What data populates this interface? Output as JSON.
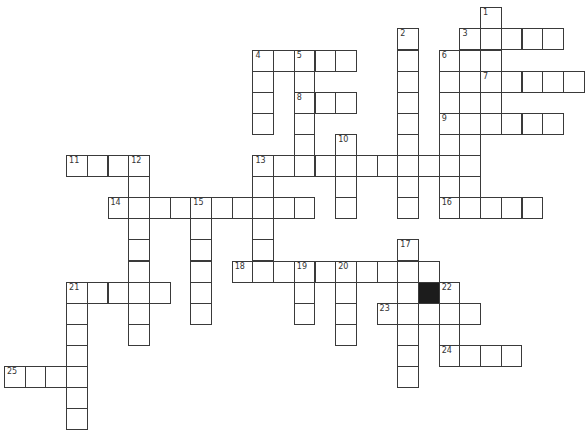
{
  "puzzle": {
    "cell_width": 20.7,
    "cell_height": 21.1,
    "origin_x": 4,
    "origin_y": 7.3,
    "colors": {
      "line": "#3a3a3a",
      "block": "#1c1c1c",
      "background": "#ffffff",
      "number": "#333333"
    },
    "black_cells": [
      [
        20,
        13
      ]
    ],
    "entries": [
      {
        "number": "1",
        "direction": "down",
        "col": 23,
        "row": 0,
        "length": 5
      },
      {
        "number": "2",
        "direction": "down",
        "col": 19,
        "row": 1,
        "length": 9
      },
      {
        "number": "3",
        "direction": "across",
        "col": 22,
        "row": 1,
        "length": 5
      },
      {
        "number": "3",
        "direction": "down",
        "col": 22,
        "row": 1,
        "length": 9
      },
      {
        "number": "4",
        "direction": "across",
        "col": 12,
        "row": 2,
        "length": 5
      },
      {
        "number": "4",
        "direction": "down",
        "col": 12,
        "row": 2,
        "length": 4
      },
      {
        "number": "5",
        "direction": "down",
        "col": 14,
        "row": 2,
        "length": 6
      },
      {
        "number": "6",
        "direction": "down",
        "col": 21,
        "row": 2,
        "length": 8
      },
      {
        "number": "7",
        "direction": "across",
        "col": 23,
        "row": 3,
        "length": 5
      },
      {
        "number": "8",
        "direction": "across",
        "col": 14,
        "row": 4,
        "length": 3
      },
      {
        "number": "9",
        "direction": "across",
        "col": 21,
        "row": 5,
        "length": 6
      },
      {
        "number": "10",
        "direction": "down",
        "col": 16,
        "row": 6,
        "length": 4
      },
      {
        "number": "11",
        "direction": "across",
        "col": 3,
        "row": 7,
        "length": 4
      },
      {
        "number": "12",
        "direction": "down",
        "col": 6,
        "row": 7,
        "length": 9
      },
      {
        "number": "13",
        "direction": "across",
        "col": 12,
        "row": 7,
        "length": 11
      },
      {
        "number": "13",
        "direction": "down",
        "col": 12,
        "row": 7,
        "length": 6
      },
      {
        "number": "14",
        "direction": "across",
        "col": 5,
        "row": 9,
        "length": 10
      },
      {
        "number": "15",
        "direction": "down",
        "col": 9,
        "row": 9,
        "length": 6
      },
      {
        "number": "16",
        "direction": "across",
        "col": 21,
        "row": 9,
        "length": 5
      },
      {
        "number": "17",
        "direction": "down",
        "col": 19,
        "row": 11,
        "length": 7
      },
      {
        "number": "18",
        "direction": "across",
        "col": 11,
        "row": 12,
        "length": 10
      },
      {
        "number": "19",
        "direction": "down",
        "col": 14,
        "row": 12,
        "length": 3
      },
      {
        "number": "20",
        "direction": "down",
        "col": 16,
        "row": 12,
        "length": 4
      },
      {
        "number": "21",
        "direction": "across",
        "col": 3,
        "row": 13,
        "length": 5
      },
      {
        "number": "21",
        "direction": "down",
        "col": 3,
        "row": 13,
        "length": 7
      },
      {
        "number": "22",
        "direction": "down",
        "col": 21,
        "row": 13,
        "length": 4
      },
      {
        "number": "23",
        "direction": "across",
        "col": 18,
        "row": 14,
        "length": 5
      },
      {
        "number": "24",
        "direction": "across",
        "col": 21,
        "row": 16,
        "length": 4
      },
      {
        "number": "25",
        "direction": "across",
        "col": 0,
        "row": 17,
        "length": 4
      }
    ]
  }
}
